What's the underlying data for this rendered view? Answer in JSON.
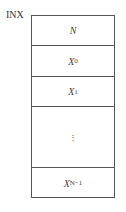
{
  "diagram": {
    "label": "INX",
    "cells": [
      {
        "main": "N",
        "sub": ""
      },
      {
        "main": "X",
        "sub": "0"
      },
      {
        "main": "X",
        "sub": "1"
      },
      {
        "main": "⋮",
        "sub": ""
      },
      {
        "main": "X",
        "sub": "N−1"
      }
    ]
  }
}
